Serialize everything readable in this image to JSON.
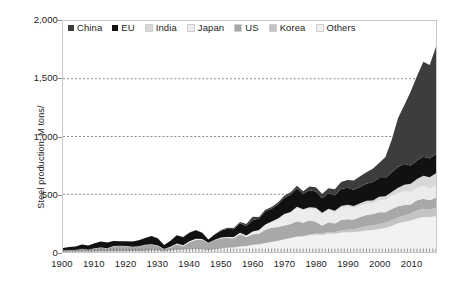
{
  "chart_data": {
    "type": "area",
    "stacked": true,
    "title": "",
    "xlabel": "",
    "ylabel": "Steel production, M tons/",
    "xlim": [
      1900,
      2018
    ],
    "ylim": [
      0,
      2000
    ],
    "ytick_labels": [
      "0",
      "500",
      "1,000",
      "1,500",
      "2,000"
    ],
    "ytick_values": [
      0,
      500,
      1000,
      1500,
      2000
    ],
    "xtick_labels": [
      "1900",
      "1910",
      "1920",
      "1930",
      "1940",
      "1950",
      "1960",
      "1970",
      "1980",
      "1990",
      "2000",
      "2010"
    ],
    "xtick_values": [
      1900,
      1910,
      1920,
      1930,
      1940,
      1950,
      1960,
      1970,
      1980,
      1990,
      2000,
      2010
    ],
    "grid": "horizontal-dotted",
    "gridlines": [
      500,
      1000,
      1500
    ],
    "legend_position": "top-left-inside",
    "stack_order_bottom_to_top": [
      "Others",
      "Korea",
      "US",
      "Japan",
      "India",
      "EU",
      "China"
    ],
    "colors": {
      "China": "#3d3d3d",
      "EU": "#111111",
      "India": "#d8d8d8",
      "Japan": "#ececec",
      "US": "#a8a8a8",
      "Korea": "#c4c4c4",
      "Others": "#f2f2f2"
    },
    "x": [
      1900,
      1902,
      1904,
      1906,
      1908,
      1910,
      1912,
      1914,
      1916,
      1918,
      1920,
      1922,
      1924,
      1926,
      1928,
      1930,
      1932,
      1934,
      1936,
      1938,
      1940,
      1942,
      1944,
      1946,
      1948,
      1950,
      1952,
      1954,
      1956,
      1958,
      1960,
      1962,
      1964,
      1966,
      1968,
      1970,
      1972,
      1974,
      1976,
      1978,
      1980,
      1982,
      1984,
      1986,
      1988,
      1990,
      1992,
      1994,
      1996,
      1998,
      2000,
      2002,
      2004,
      2006,
      2008,
      2010,
      2012,
      2014,
      2016,
      2018
    ],
    "series": [
      {
        "name": "China",
        "values": [
          0,
          0,
          0,
          0,
          0,
          0,
          0,
          0,
          0,
          0,
          0,
          0,
          0,
          0,
          1,
          1,
          1,
          1,
          2,
          2,
          2,
          2,
          1,
          1,
          1,
          6,
          8,
          9,
          12,
          18,
          29,
          12,
          12,
          15,
          16,
          18,
          23,
          25,
          21,
          32,
          37,
          37,
          43,
          52,
          59,
          66,
          81,
          92,
          101,
          115,
          129,
          182,
          283,
          423,
          512,
          639,
          731,
          823,
          808,
          928
        ]
      },
      {
        "name": "EU",
        "values": [
          22,
          26,
          30,
          36,
          38,
          44,
          52,
          50,
          44,
          38,
          40,
          44,
          52,
          58,
          70,
          60,
          34,
          52,
          70,
          70,
          72,
          74,
          55,
          28,
          45,
          60,
          72,
          68,
          82,
          82,
          98,
          100,
          114,
          112,
          122,
          138,
          148,
          158,
          134,
          148,
          140,
          126,
          134,
          133,
          148,
          148,
          140,
          142,
          147,
          159,
          163,
          159,
          170,
          180,
          178,
          160,
          160,
          165,
          162,
          168
        ]
      },
      {
        "name": "India",
        "values": [
          0,
          0,
          0,
          0,
          0,
          0,
          1,
          1,
          1,
          1,
          1,
          1,
          1,
          1,
          2,
          2,
          1,
          2,
          2,
          2,
          2,
          2,
          1,
          1,
          1,
          2,
          2,
          2,
          2,
          2,
          3,
          5,
          6,
          6,
          7,
          7,
          7,
          7,
          9,
          10,
          10,
          11,
          11,
          13,
          15,
          15,
          18,
          20,
          24,
          24,
          27,
          29,
          33,
          44,
          58,
          69,
          78,
          87,
          96,
          107
        ]
      },
      {
        "name": "Japan",
        "values": [
          0,
          0,
          0,
          1,
          1,
          1,
          1,
          1,
          1,
          1,
          1,
          1,
          1,
          2,
          2,
          2,
          2,
          3,
          5,
          6,
          7,
          8,
          6,
          1,
          2,
          5,
          7,
          8,
          11,
          12,
          22,
          28,
          40,
          48,
          67,
          93,
          97,
          117,
          107,
          102,
          111,
          100,
          106,
          98,
          106,
          110,
          98,
          99,
          99,
          94,
          106,
          108,
          113,
          116,
          119,
          110,
          107,
          111,
          105,
          103
        ]
      },
      {
        "name": "US",
        "values": [
          10,
          15,
          14,
          24,
          14,
          26,
          31,
          24,
          43,
          45,
          42,
          36,
          38,
          49,
          52,
          41,
          14,
          26,
          48,
          29,
          61,
          78,
          81,
          60,
          80,
          88,
          85,
          80,
          105,
          77,
          91,
          89,
          115,
          122,
          119,
          119,
          121,
          132,
          116,
          124,
          101,
          68,
          84,
          74,
          90,
          89,
          84,
          91,
          95,
          98,
          102,
          92,
          99,
          99,
          91,
          80,
          89,
          88,
          78,
          87
        ]
      },
      {
        "name": "Korea",
        "values": [
          0,
          0,
          0,
          0,
          0,
          0,
          0,
          0,
          0,
          0,
          0,
          0,
          0,
          0,
          0,
          0,
          0,
          0,
          0,
          0,
          0,
          0,
          0,
          0,
          0,
          0,
          0,
          0,
          0,
          0,
          0,
          0,
          0,
          1,
          1,
          1,
          2,
          3,
          4,
          5,
          9,
          12,
          13,
          15,
          19,
          23,
          28,
          33,
          39,
          40,
          43,
          45,
          48,
          48,
          53,
          59,
          69,
          72,
          69,
          72
        ]
      },
      {
        "name": "Others",
        "values": [
          2,
          2,
          3,
          4,
          4,
          5,
          6,
          6,
          7,
          7,
          8,
          8,
          9,
          11,
          12,
          12,
          9,
          14,
          19,
          21,
          24,
          26,
          24,
          18,
          24,
          30,
          36,
          40,
          48,
          52,
          62,
          68,
          78,
          86,
          96,
          110,
          120,
          132,
          134,
          146,
          152,
          148,
          160,
          158,
          168,
          172,
          170,
          178,
          186,
          190,
          200,
          208,
          226,
          250,
          262,
          272,
          290,
          302,
          300,
          312
        ]
      }
    ]
  },
  "legend": {
    "items": [
      {
        "label": "China",
        "color": "#3d3d3d"
      },
      {
        "label": "EU",
        "color": "#111111"
      },
      {
        "label": "India",
        "color": "#d8d8d8"
      },
      {
        "label": "Japan",
        "color": "#ececec"
      },
      {
        "label": "US",
        "color": "#a8a8a8"
      },
      {
        "label": "Korea",
        "color": "#c4c4c4"
      },
      {
        "label": "Others",
        "color": "#f2f2f2"
      }
    ]
  }
}
